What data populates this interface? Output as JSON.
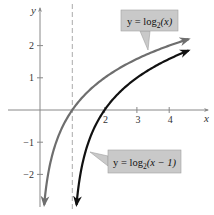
{
  "chart_data": {
    "type": "line",
    "title": "",
    "xlabel": "x",
    "ylabel": "y",
    "xlim": [
      -0.6,
      4.7
    ],
    "ylim": [
      -2.9,
      2.6
    ],
    "grid": false,
    "x_ticks": [
      2,
      3,
      4
    ],
    "x_tick_labels": [
      "2",
      "3",
      "4"
    ],
    "y_ticks": [
      2,
      1,
      -1,
      -2
    ],
    "y_tick_labels": [
      "2",
      "1",
      "−1",
      "−2"
    ],
    "asymptote": {
      "x": 1,
      "style": "dashed"
    },
    "series": [
      {
        "name": "y = log2(x)",
        "function": "log2(x)",
        "color": "#6e6e6e",
        "x": [
          0.13,
          0.25,
          0.5,
          1,
          2,
          3,
          4,
          4.6
        ],
        "values": [
          -2.94,
          -2,
          -1,
          0,
          1,
          1.58,
          2,
          2.2
        ],
        "label": {
          "prefix": "y = log",
          "sub": "2",
          "suffix": "(x)"
        }
      },
      {
        "name": "y = log2(x − 1)",
        "function": "log2(x-1)",
        "color": "#111111",
        "x": [
          1.13,
          1.25,
          1.5,
          2,
          3,
          4,
          4.6
        ],
        "values": [
          -2.94,
          -2,
          -1,
          0,
          1,
          1.58,
          1.85
        ],
        "label": {
          "prefix": "y = log",
          "sub": "2",
          "suffix": "(x − 1)"
        }
      }
    ]
  },
  "colors": {
    "axis": "#888888",
    "asymptote": "#aaaaaa",
    "callout_bg": "#c9c9c9",
    "callout_border": "#a0a0a0"
  }
}
